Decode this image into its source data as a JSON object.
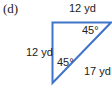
{
  "figure": {
    "part_label": "(d)",
    "shape": "right isosceles triangle",
    "line_color": "#3f74c8",
    "sides": {
      "top": "12 yd",
      "left": "12 yd",
      "hypotenuse": "17 yd"
    },
    "angles": {
      "top_right": "45°",
      "bottom": "45°"
    }
  }
}
